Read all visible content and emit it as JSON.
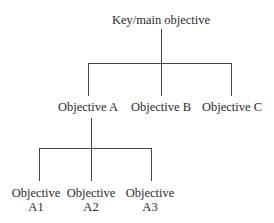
{
  "diagram": {
    "type": "hierarchy-tree",
    "root": {
      "label": "Key/main objective",
      "children": [
        {
          "label": "Objective A",
          "children": [
            {
              "line1": "Objective",
              "line2": "A1"
            },
            {
              "line1": "Objective",
              "line2": "A2"
            },
            {
              "line1": "Objective",
              "line2": "A3"
            }
          ]
        },
        {
          "label": "Objective B"
        },
        {
          "label": "Objective C"
        }
      ]
    },
    "line_color": "#444444"
  }
}
